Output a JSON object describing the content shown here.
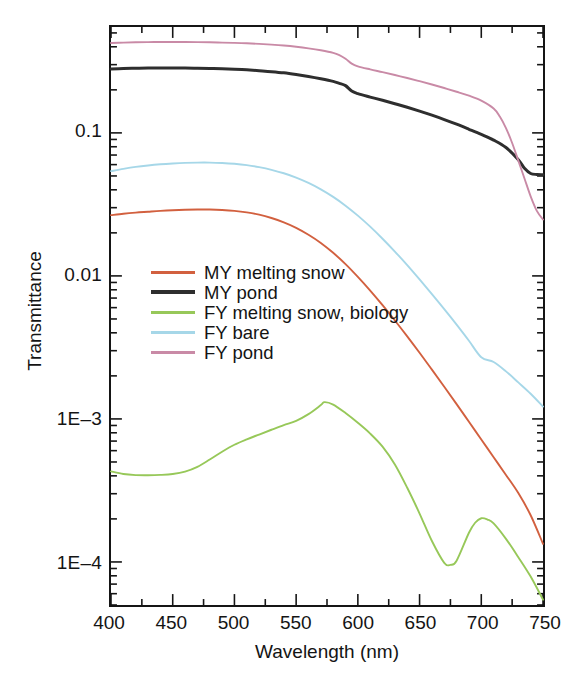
{
  "chart_data": {
    "type": "line",
    "title": "",
    "xlabel": "Wavelength (nm)",
    "ylabel": "Transmittance",
    "xlim": [
      400,
      750
    ],
    "ylim": [
      5e-05,
      0.55
    ],
    "yscale": "log",
    "xscale": "linear",
    "grid": false,
    "legend_position": "center-left",
    "xticks": [
      400,
      450,
      500,
      550,
      600,
      650,
      700,
      750
    ],
    "xtick_labels": [
      "400",
      "450",
      "500",
      "550",
      "600",
      "650",
      "700",
      "750"
    ],
    "xminor_step": 25,
    "yticks": [
      0.1,
      0.01,
      0.001,
      0.0001
    ],
    "ytick_labels": [
      "0.1",
      "0.01",
      "1E–3",
      "1E–4"
    ],
    "series": [
      {
        "name": "MY melting snow",
        "color": "#d2603f",
        "x": [
          400,
          410,
          420,
          430,
          440,
          450,
          460,
          470,
          480,
          490,
          500,
          510,
          520,
          530,
          540,
          550,
          560,
          570,
          580,
          590,
          600,
          610,
          620,
          630,
          640,
          650,
          660,
          670,
          680,
          690,
          700,
          710,
          720,
          730,
          740,
          750
        ],
        "y": [
          0.0266,
          0.0272,
          0.0277,
          0.0281,
          0.0285,
          0.0288,
          0.029,
          0.0291,
          0.0291,
          0.0289,
          0.0285,
          0.0278,
          0.0268,
          0.0254,
          0.0237,
          0.0217,
          0.0194,
          0.017,
          0.0145,
          0.0121,
          0.00985,
          0.0079,
          0.00625,
          0.00488,
          0.00378,
          0.0029,
          0.00221,
          0.00168,
          0.00127,
          0.000955,
          0.000718,
          0.00054,
          0.000406,
          0.000303,
          0.000212,
          0.000134
        ]
      },
      {
        "name": "MY pond",
        "color": "#2e2e2e",
        "x": [
          400,
          410,
          420,
          430,
          440,
          450,
          460,
          470,
          480,
          490,
          500,
          510,
          520,
          530,
          540,
          550,
          560,
          570,
          580,
          585,
          590,
          595,
          600,
          610,
          620,
          630,
          640,
          650,
          660,
          670,
          680,
          690,
          700,
          710,
          720,
          730,
          735,
          740,
          745,
          750
        ],
        "y": [
          0.28,
          0.282,
          0.283,
          0.284,
          0.284,
          0.284,
          0.284,
          0.283,
          0.282,
          0.281,
          0.279,
          0.276,
          0.272,
          0.268,
          0.263,
          0.256,
          0.248,
          0.239,
          0.229,
          0.222,
          0.214,
          0.196,
          0.188,
          0.178,
          0.169,
          0.16,
          0.151,
          0.142,
          0.133,
          0.124,
          0.115,
          0.106,
          0.0975,
          0.089,
          0.079,
          0.065,
          0.0565,
          0.052,
          0.0512,
          0.051
        ]
      },
      {
        "name": "FY melting snow, biology",
        "color": "#97c859",
        "x": [
          400,
          410,
          420,
          430,
          440,
          450,
          460,
          470,
          480,
          490,
          500,
          510,
          520,
          530,
          540,
          550,
          560,
          570,
          573,
          580,
          590,
          600,
          610,
          620,
          630,
          640,
          650,
          660,
          670,
          675,
          680,
          690,
          695,
          700,
          705,
          710,
          720,
          730,
          740,
          750
        ],
        "y": [
          0.00043,
          0.000412,
          0.000405,
          0.000404,
          0.000406,
          0.000412,
          0.000428,
          0.000462,
          0.00052,
          0.00059,
          0.00066,
          0.00072,
          0.000778,
          0.00084,
          0.000905,
          0.00097,
          0.00108,
          0.00125,
          0.00131,
          0.00126,
          0.0011,
          0.00094,
          0.00079,
          0.00064,
          0.00048,
          0.00033,
          0.000218,
          0.00014,
          9.85e-05,
          9.55e-05,
          0.000102,
          0.00016,
          0.000188,
          0.000202,
          0.000198,
          0.000186,
          0.000145,
          0.000108,
          7.9e-05,
          5.45e-05
        ]
      },
      {
        "name": "FY bare",
        "color": "#a6d7e8",
        "x": [
          400,
          410,
          420,
          430,
          440,
          450,
          460,
          470,
          480,
          490,
          500,
          510,
          520,
          530,
          540,
          550,
          560,
          570,
          580,
          590,
          600,
          610,
          620,
          630,
          640,
          650,
          660,
          670,
          680,
          690,
          700,
          710,
          720,
          730,
          740,
          750
        ],
        "y": [
          0.054,
          0.056,
          0.0578,
          0.0592,
          0.0603,
          0.0611,
          0.0617,
          0.062,
          0.062,
          0.0616,
          0.0608,
          0.0595,
          0.0576,
          0.0552,
          0.0522,
          0.0487,
          0.0447,
          0.0403,
          0.0357,
          0.031,
          0.0264,
          0.0221,
          0.0182,
          0.0148,
          0.0119,
          0.00945,
          0.00745,
          0.00585,
          0.00456,
          0.00352,
          0.0027,
          0.0025,
          0.00215,
          0.0018,
          0.0015,
          0.00122
        ]
      },
      {
        "name": "FY pond",
        "color": "#c98aa6",
        "x": [
          400,
          410,
          420,
          430,
          440,
          450,
          460,
          470,
          480,
          490,
          500,
          510,
          520,
          530,
          540,
          550,
          560,
          570,
          580,
          585,
          590,
          595,
          600,
          610,
          620,
          630,
          640,
          650,
          660,
          670,
          680,
          690,
          700,
          710,
          715,
          720,
          725,
          730,
          735,
          740,
          745,
          750
        ],
        "y": [
          0.425,
          0.428,
          0.43,
          0.431,
          0.432,
          0.432,
          0.432,
          0.431,
          0.43,
          0.428,
          0.426,
          0.423,
          0.419,
          0.414,
          0.408,
          0.4,
          0.39,
          0.378,
          0.363,
          0.35,
          0.33,
          0.305,
          0.292,
          0.278,
          0.266,
          0.254,
          0.242,
          0.23,
          0.218,
          0.206,
          0.194,
          0.182,
          0.168,
          0.148,
          0.13,
          0.108,
          0.085,
          0.064,
          0.048,
          0.036,
          0.0285,
          0.0248
        ]
      }
    ]
  },
  "axes": {
    "y_title": "Transmittance",
    "x_title": "Wavelength (nm)"
  },
  "legend": {
    "entries": [
      {
        "label": "MY melting snow",
        "color": "#d2603f"
      },
      {
        "label": "MY pond",
        "color": "#2e2e2e"
      },
      {
        "label": "FY melting snow, biology",
        "color": "#97c859"
      },
      {
        "label": "FY bare",
        "color": "#a6d7e8"
      },
      {
        "label": "FY pond",
        "color": "#c98aa6"
      }
    ]
  },
  "caption": {
    "text": ""
  }
}
